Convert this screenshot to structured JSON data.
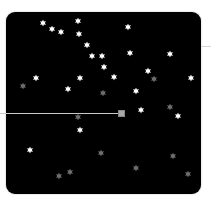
{
  "board": {
    "background": "#000000",
    "colors": {
      "bright_star": "#ffffff",
      "dim_star": "#6e6e6e",
      "line": "#c8c8c8",
      "handle": "#a8a8a8"
    }
  },
  "slider": {
    "line_end_x": 118,
    "handle": {
      "x": 118,
      "y": 110
    }
  },
  "stars": [
    {
      "x": 43,
      "y": 23,
      "kind": "bright"
    },
    {
      "x": 52,
      "y": 29,
      "kind": "bright"
    },
    {
      "x": 61,
      "y": 32,
      "kind": "bright"
    },
    {
      "x": 78,
      "y": 21,
      "kind": "bright"
    },
    {
      "x": 79,
      "y": 34,
      "kind": "bright"
    },
    {
      "x": 128,
      "y": 27,
      "kind": "bright"
    },
    {
      "x": 87,
      "y": 45,
      "kind": "bright"
    },
    {
      "x": 92,
      "y": 56,
      "kind": "bright"
    },
    {
      "x": 102,
      "y": 56,
      "kind": "bright"
    },
    {
      "x": 130,
      "y": 53,
      "kind": "bright"
    },
    {
      "x": 170,
      "y": 54,
      "kind": "bright"
    },
    {
      "x": 104,
      "y": 67,
      "kind": "bright"
    },
    {
      "x": 148,
      "y": 71,
      "kind": "bright"
    },
    {
      "x": 36,
      "y": 78,
      "kind": "bright"
    },
    {
      "x": 80,
      "y": 78,
      "kind": "bright"
    },
    {
      "x": 114,
      "y": 77,
      "kind": "bright"
    },
    {
      "x": 191,
      "y": 78,
      "kind": "bright"
    },
    {
      "x": 68,
      "y": 89,
      "kind": "bright"
    },
    {
      "x": 136,
      "y": 91,
      "kind": "bright"
    },
    {
      "x": 141,
      "y": 110,
      "kind": "bright"
    },
    {
      "x": 178,
      "y": 116,
      "kind": "bright"
    },
    {
      "x": 80,
      "y": 130,
      "kind": "bright"
    },
    {
      "x": 30,
      "y": 150,
      "kind": "bright"
    },
    {
      "x": 23,
      "y": 86,
      "kind": "dim"
    },
    {
      "x": 154,
      "y": 79,
      "kind": "dim"
    },
    {
      "x": 103,
      "y": 93,
      "kind": "dim"
    },
    {
      "x": 170,
      "y": 107,
      "kind": "dim"
    },
    {
      "x": 78,
      "y": 117,
      "kind": "dim"
    },
    {
      "x": 101,
      "y": 153,
      "kind": "dim"
    },
    {
      "x": 173,
      "y": 156,
      "kind": "dim"
    },
    {
      "x": 59,
      "y": 176,
      "kind": "dim"
    },
    {
      "x": 70,
      "y": 172,
      "kind": "dim"
    },
    {
      "x": 136,
      "y": 168,
      "kind": "dim"
    },
    {
      "x": 188,
      "y": 174,
      "kind": "dim"
    }
  ]
}
